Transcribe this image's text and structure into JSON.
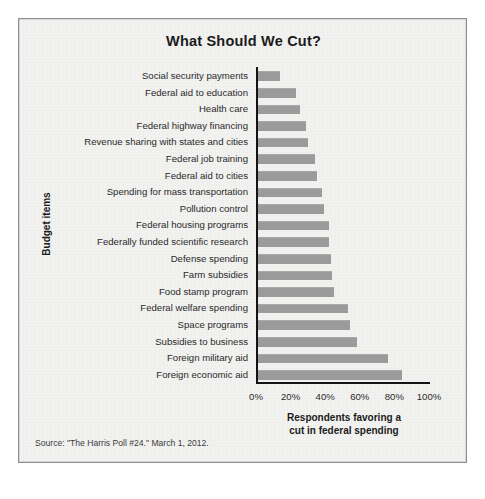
{
  "figure": {
    "title": "What Should We Cut?",
    "source_note": "Source: \"The Harris Poll #24.\" March 1, 2012.",
    "bar_color": "#9b9b9b",
    "axis_color": "#141414",
    "background_color": "#f2f2f0",
    "border_color": "#8f8f8f"
  },
  "chart_data": {
    "type": "bar",
    "orientation": "horizontal",
    "title": "What Should We Cut?",
    "xlabel": "Respondents favoring a cut in federal spending",
    "ylabel": "Budget items",
    "xlim": [
      0,
      100
    ],
    "xticks": [
      0,
      20,
      40,
      60,
      80,
      100
    ],
    "xticklabels": [
      "0%",
      "20%",
      "40%",
      "60%",
      "80%",
      "100%"
    ],
    "grid": false,
    "legend": false,
    "units": "percent",
    "categories": [
      "Social security payments",
      "Federal aid to education",
      "Health care",
      "Federal highway financing",
      "Revenue sharing with states and cities",
      "Federal job training",
      "Federal aid to cities",
      "Spending for mass transportation",
      "Pollution control",
      "Federal housing programs",
      "Federally funded scientific research",
      "Defense spending",
      "Farm subsidies",
      "Food stamp program",
      "Federal welfare spending",
      "Space programs",
      "Subsidies to business",
      "Foreign military aid",
      "Foreign economic aid"
    ],
    "values": [
      13,
      22,
      24,
      28,
      29,
      33,
      34,
      37,
      38,
      41,
      41,
      42,
      43,
      44,
      52,
      53,
      57,
      75,
      83
    ]
  },
  "axis_titles": {
    "x": [
      "Respondents favoring a",
      "cut in federal spending"
    ],
    "y": "Budget items"
  }
}
